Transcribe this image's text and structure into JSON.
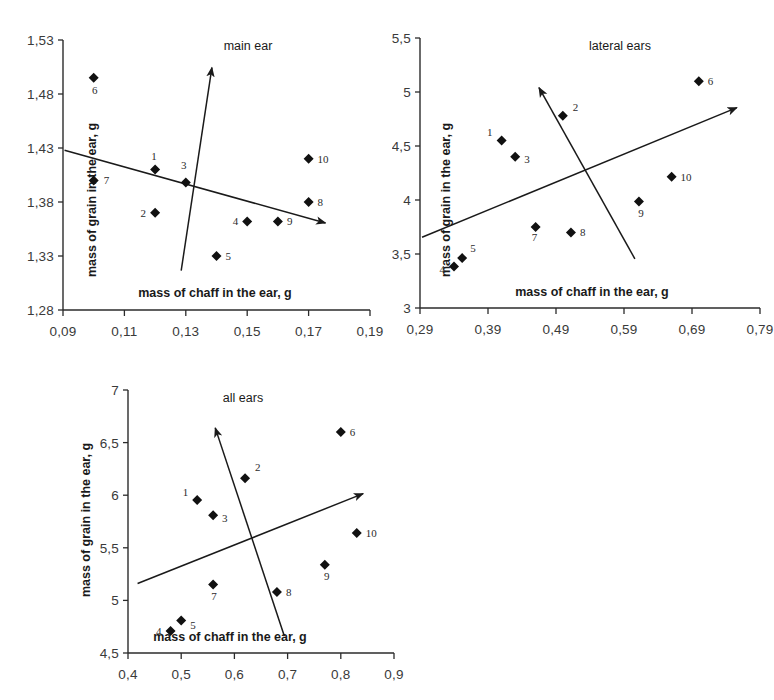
{
  "figure": {
    "axis_x_title": "mass of chaff in the ear, g",
    "axis_y_title": "mass of grain in the ear, g"
  },
  "chart_data": [
    {
      "type": "scatter",
      "title": "main ear",
      "xlabel": "mass of chaff in the ear, g",
      "ylabel": "mass of grain in the ear, g",
      "xlim": [
        0.09,
        0.19
      ],
      "ylim": [
        1.28,
        1.53
      ],
      "xticks": [
        "0,09",
        "0,11",
        "0,13",
        "0,15",
        "0,17",
        "0,19"
      ],
      "xtick_values": [
        0.09,
        0.11,
        0.13,
        0.15,
        0.17,
        0.19
      ],
      "yticks": [
        "1,53",
        "1,48",
        "1,43",
        "1,38",
        "1,33",
        "1,28"
      ],
      "ytick_values": [
        1.53,
        1.48,
        1.43,
        1.38,
        1.33,
        1.28
      ],
      "grid": false,
      "legend": "none",
      "points": [
        {
          "label": "1",
          "x": 0.12,
          "y": 1.41
        },
        {
          "label": "2",
          "x": 0.12,
          "y": 1.37
        },
        {
          "label": "3",
          "x": 0.13,
          "y": 1.398
        },
        {
          "label": "4",
          "x": 0.15,
          "y": 1.362
        },
        {
          "label": "5",
          "x": 0.14,
          "y": 1.33
        },
        {
          "label": "6",
          "x": 0.1,
          "y": 1.495
        },
        {
          "label": "7",
          "x": 0.1,
          "y": 1.4
        },
        {
          "label": "8",
          "x": 0.17,
          "y": 1.38
        },
        {
          "label": "9",
          "x": 0.16,
          "y": 1.362
        },
        {
          "label": "10",
          "x": 0.17,
          "y": 1.42
        }
      ],
      "axes_vectors": [
        {
          "name": "first-axis-arrow",
          "x1": 0.0905,
          "y1": 1.428,
          "x2": 0.1755,
          "y2": 1.3605
        },
        {
          "name": "second-axis-arrow",
          "x1": 0.1285,
          "y1": 1.3165,
          "x2": 0.1385,
          "y2": 1.5045
        }
      ]
    },
    {
      "type": "scatter",
      "title": "lateral ears",
      "xlabel": "mass of chaff in the ear, g",
      "ylabel": "mass of grain in the ear, g",
      "xlim": [
        0.29,
        0.79
      ],
      "ylim": [
        3.0,
        5.5
      ],
      "xticks": [
        "0,29",
        "0,39",
        "0,49",
        "0,59",
        "0,69",
        "0,79"
      ],
      "xtick_values": [
        0.29,
        0.39,
        0.49,
        0.59,
        0.69,
        0.79
      ],
      "yticks": [
        "5,5",
        "5",
        "4,5",
        "4",
        "3,5",
        "3"
      ],
      "ytick_values": [
        5.5,
        5.0,
        4.5,
        4.0,
        3.5,
        3.0
      ],
      "grid": false,
      "legend": "none",
      "points": [
        {
          "label": "1",
          "x": 0.41,
          "y": 4.55
        },
        {
          "label": "2",
          "x": 0.5,
          "y": 4.78
        },
        {
          "label": "3",
          "x": 0.43,
          "y": 4.4
        },
        {
          "label": "4",
          "x": 0.34,
          "y": 3.385
        },
        {
          "label": "5",
          "x": 0.352,
          "y": 3.462
        },
        {
          "label": "6",
          "x": 0.7,
          "y": 5.1
        },
        {
          "label": "7",
          "x": 0.46,
          "y": 3.75
        },
        {
          "label": "8",
          "x": 0.512,
          "y": 3.7
        },
        {
          "label": "9",
          "x": 0.612,
          "y": 3.985
        },
        {
          "label": "10",
          "x": 0.66,
          "y": 4.215
        }
      ],
      "axes_vectors": [
        {
          "name": "first-axis-arrow",
          "x1": 0.293,
          "y1": 3.655,
          "x2": 0.756,
          "y2": 4.855
        },
        {
          "name": "second-axis-arrow",
          "x1": 0.606,
          "y1": 3.455,
          "x2": 0.465,
          "y2": 5.04
        }
      ]
    },
    {
      "type": "scatter",
      "title": "all ears",
      "xlabel": "mass of chaff in the ear, g",
      "ylabel": "mass of grain in the ear, g",
      "xlim": [
        0.4,
        0.9
      ],
      "ylim": [
        4.5,
        7.0
      ],
      "xticks": [
        "0,4",
        "0,5",
        "0,6",
        "0,7",
        "0,8",
        "0,9"
      ],
      "xtick_values": [
        0.4,
        0.5,
        0.6,
        0.7,
        0.8,
        0.9
      ],
      "yticks": [
        "7",
        "6,5",
        "6",
        "5,5",
        "5",
        "4,5"
      ],
      "ytick_values": [
        7.0,
        6.5,
        6.0,
        5.5,
        5.0,
        4.5
      ],
      "grid": false,
      "legend": "none",
      "points": [
        {
          "label": "1",
          "x": 0.53,
          "y": 5.955
        },
        {
          "label": "2",
          "x": 0.62,
          "y": 6.16
        },
        {
          "label": "3",
          "x": 0.56,
          "y": 5.81
        },
        {
          "label": "4",
          "x": 0.48,
          "y": 4.71
        },
        {
          "label": "5",
          "x": 0.5,
          "y": 4.81
        },
        {
          "label": "6",
          "x": 0.8,
          "y": 6.6
        },
        {
          "label": "7",
          "x": 0.56,
          "y": 5.15
        },
        {
          "label": "8",
          "x": 0.68,
          "y": 5.08
        },
        {
          "label": "9",
          "x": 0.77,
          "y": 5.34
        },
        {
          "label": "10",
          "x": 0.83,
          "y": 5.64
        }
      ],
      "axes_vectors": [
        {
          "name": "first-axis-arrow",
          "x1": 0.418,
          "y1": 5.16,
          "x2": 0.842,
          "y2": 6.015
        },
        {
          "name": "second-axis-arrow",
          "x1": 0.694,
          "y1": 4.66,
          "x2": 0.564,
          "y2": 6.64
        }
      ]
    }
  ]
}
